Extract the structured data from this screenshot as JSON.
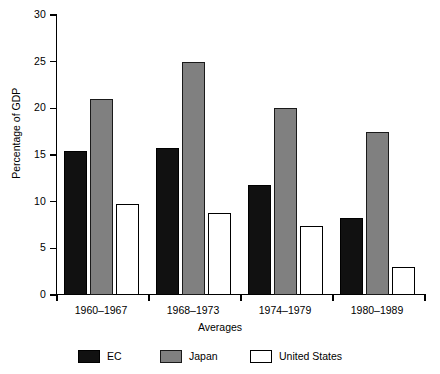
{
  "chart_data": {
    "type": "bar",
    "title": "",
    "xlabel": "Averages",
    "ylabel": "Percentage of GDP",
    "categories": [
      "1960–1967",
      "1968–1973",
      "1974–1979",
      "1980–1989"
    ],
    "series": [
      {
        "name": "EC",
        "color": "#111111",
        "values": [
          15.4,
          15.8,
          11.8,
          8.2
        ]
      },
      {
        "name": "Japan",
        "color": "#808080",
        "values": [
          21.0,
          25.0,
          20.0,
          17.5
        ]
      },
      {
        "name": "United States",
        "color": "#ffffff",
        "values": [
          9.7,
          8.8,
          7.4,
          3.0
        ]
      }
    ],
    "ylim": [
      0,
      30
    ],
    "yticks": [
      0,
      5,
      10,
      15,
      20,
      25,
      30
    ],
    "ytick_labels": [
      "0",
      "5",
      "10",
      "15",
      "20",
      "25",
      "30"
    ],
    "grid": false,
    "legend_position": "bottom"
  },
  "legend": {
    "items": [
      {
        "label": "EC"
      },
      {
        "label": "Japan"
      },
      {
        "label": "United States"
      }
    ]
  }
}
